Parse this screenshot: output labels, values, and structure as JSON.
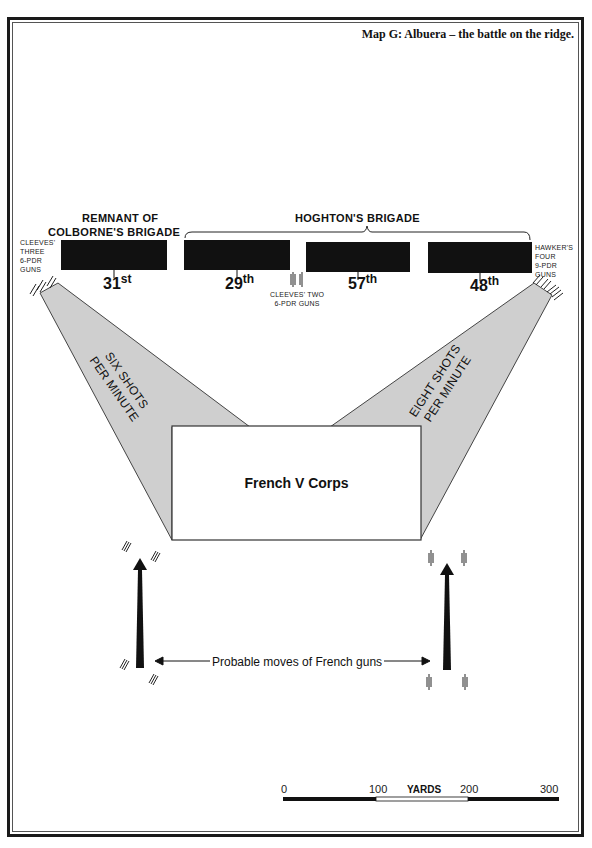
{
  "map": {
    "title": "Map G: Albuera – the battle on the ridge.",
    "brigades": {
      "colborne": {
        "line1": "REMNANT  OF",
        "line2": "COLBORNE'S   BRIGADE"
      },
      "hoghton": {
        "label": "HOGHTON'S    BRIGADE"
      }
    },
    "regiments": [
      {
        "number": "31",
        "suffix": "st"
      },
      {
        "number": "29",
        "suffix": "th"
      },
      {
        "number": "57",
        "suffix": "th"
      },
      {
        "number": "48",
        "suffix": "th"
      }
    ],
    "artillery": {
      "cleeves_three": [
        "CLEEVES'",
        "THREE",
        "6-PDR",
        "GUNS"
      ],
      "cleeves_two": [
        "CLEEVES' TWO",
        "6-PDR GUNS"
      ],
      "hawker_four": [
        "HAWKER'S",
        "FOUR",
        "9-PDR",
        "GUNS"
      ]
    },
    "fire_rates": {
      "left": [
        "SIX SHOTS",
        "PER MINUTE"
      ],
      "right": [
        "EIGHT SHOTS",
        "PER MINUTE"
      ]
    },
    "enemy": {
      "label": "French V Corps"
    },
    "moves_label": "Probable moves of French guns",
    "scale": {
      "title": "YARDS",
      "ticks": [
        "0",
        "100",
        "200",
        "300"
      ]
    },
    "colors": {
      "fill_zone": "#cfcfcf",
      "ink": "#111111",
      "paper": "#ffffff"
    }
  }
}
